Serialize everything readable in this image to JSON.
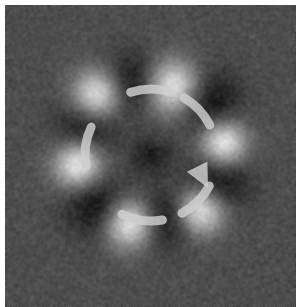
{
  "image": {
    "kind": "psychophysics-stimulus",
    "width": 296,
    "height": 307,
    "margin_left": 5,
    "margin_top": 5,
    "field": {
      "width": 291,
      "height": 302,
      "background_color": "#4c4c4c",
      "noise_amplitude": 26,
      "noise_grain": 1,
      "blur": 1.1
    },
    "center_spot": {
      "cx": 146,
      "cy": 150,
      "radius": 15,
      "color": "#1e1e1e",
      "opacity": 0.72
    },
    "blobs": [
      {
        "name": "blob-top-left",
        "angle_deg": 243,
        "bright_cx": 92,
        "bright_cy": 90,
        "bright_r": 34,
        "dark_cx": 126,
        "dark_cy": 79,
        "dark_r": 38
      },
      {
        "name": "blob-top-right",
        "angle_deg": 295,
        "bright_cx": 168,
        "bright_cy": 82,
        "bright_r": 36,
        "dark_cx": 201,
        "dark_cy": 97,
        "dark_r": 42
      },
      {
        "name": "blob-right",
        "angle_deg": 350,
        "bright_cx": 218,
        "bright_cy": 138,
        "bright_r": 31,
        "dark_cx": 212,
        "dark_cy": 176,
        "dark_r": 40
      },
      {
        "name": "blob-bottom-right",
        "angle_deg": 55,
        "bright_cx": 195,
        "bright_cy": 205,
        "bright_r": 32,
        "dark_cx": 160,
        "dark_cy": 213,
        "dark_r": 38
      },
      {
        "name": "blob-bottom-left",
        "angle_deg": 110,
        "bright_cx": 124,
        "bright_cy": 218,
        "bright_r": 33,
        "dark_cx": 93,
        "dark_cy": 200,
        "dark_r": 40
      },
      {
        "name": "blob-left",
        "angle_deg": 185,
        "bright_cx": 73,
        "bright_cy": 159,
        "bright_r": 32,
        "dark_cx": 82,
        "dark_cy": 121,
        "dark_r": 40
      }
    ],
    "rotation_arrow": {
      "direction": "clockwise",
      "color": "#cfcfcf",
      "opacity": 0.82,
      "cx": 146,
      "cy": 150,
      "radius": 66,
      "stroke_width": 9,
      "segments": [
        {
          "name": "arc-segment-top",
          "start_deg": 252,
          "end_deg": 288
        },
        {
          "name": "arc-segment-upper-right",
          "start_deg": 300,
          "end_deg": 333
        },
        {
          "name": "arc-segment-lower-right",
          "start_deg": 28,
          "end_deg": 62
        },
        {
          "name": "arc-segment-bottom",
          "start_deg": 80,
          "end_deg": 116
        },
        {
          "name": "arc-segment-left",
          "start_deg": 170,
          "end_deg": 205
        }
      ],
      "arrow_head": {
        "name": "arrow-head",
        "tip_x": 203,
        "tip_y": 183,
        "angle_deg": 333,
        "size": 24
      }
    }
  }
}
